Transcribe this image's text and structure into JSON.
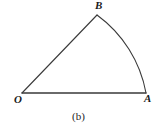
{
  "figure": {
    "caption": "(b)",
    "background_color": "#ffffff",
    "stroke_color": "#3a3a3a",
    "stroke_width": 1,
    "width": 157,
    "height": 133
  },
  "geometry": {
    "points": {
      "O": {
        "label": "O",
        "x": 22,
        "y": 93
      },
      "A": {
        "label": "A",
        "x": 146,
        "y": 93
      },
      "B": {
        "label": "B",
        "x": 97,
        "y": 15
      }
    },
    "segments": [
      {
        "name": "radius-OA",
        "from": "O",
        "to": "A",
        "path": "M 22 93 L 146 93"
      },
      {
        "name": "radius-OB",
        "from": "O",
        "to": "B",
        "path": "M 22 93 L 97 15"
      }
    ],
    "arc": {
      "name": "arc-BA",
      "from": "B",
      "to": "A",
      "radius": 124,
      "path": "M 97 15 A 124 124 0 0 1 146 93"
    },
    "label_offsets": {
      "O": {
        "x": 14,
        "y": 94
      },
      "A": {
        "x": 144,
        "y": 93
      },
      "B": {
        "x": 95,
        "y": 0
      }
    }
  },
  "chart_data": {
    "type": "diagram",
    "title": "(b)",
    "shape": "circular sector",
    "vertices": [
      "O",
      "A",
      "B"
    ],
    "annotations": [
      "O",
      "A",
      "B",
      "(b)"
    ]
  }
}
